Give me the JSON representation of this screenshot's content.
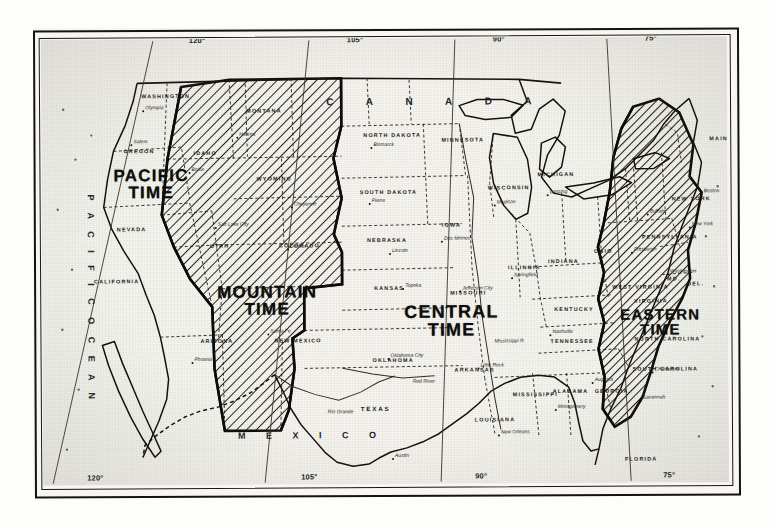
{
  "map": {
    "title": "Standard Time Zones of the United States",
    "paper_color": "#f6f5f0",
    "ink_color": "#15130f"
  },
  "zones": [
    {
      "id": "pacific",
      "line1": "PACIFIC",
      "line2": "TIME",
      "hatched": false
    },
    {
      "id": "mountain",
      "line1": "MOUNTAIN",
      "line2": "TIME",
      "hatched": true
    },
    {
      "id": "central",
      "line1": "CENTRAL",
      "line2": "TIME",
      "hatched": false
    },
    {
      "id": "eastern",
      "line1": "EASTERN",
      "line2": "TIME",
      "hatched": true
    }
  ],
  "countries": {
    "canada": "C A N A D A",
    "mexico": "M E X I C O"
  },
  "oceans": {
    "pacific": "P A C I F I C   O C E A N",
    "atlantic": "A T L A N T I C   O C E A N"
  },
  "longitude_top": [
    {
      "label": "120°",
      "x": 148
    },
    {
      "label": "105°",
      "x": 306
    },
    {
      "label": "90°",
      "x": 452
    },
    {
      "label": "75°",
      "x": 604
    }
  ],
  "longitude_bottom": [
    {
      "label": "120°",
      "x": 44
    },
    {
      "label": "105°",
      "x": 258
    },
    {
      "label": "90°",
      "x": 432
    },
    {
      "label": "75°",
      "x": 620
    }
  ],
  "states": [
    {
      "name": "WASHINGTON",
      "x": 100,
      "y": 55,
      "size": "sm"
    },
    {
      "name": "OREGON",
      "x": 82,
      "y": 110,
      "size": "sm"
    },
    {
      "name": "NEVADA",
      "x": 75,
      "y": 188,
      "size": "sm"
    },
    {
      "name": "CALIFORNIA",
      "x": 52,
      "y": 240,
      "size": "sm"
    },
    {
      "name": "IDAHO",
      "x": 152,
      "y": 112,
      "size": "sm"
    },
    {
      "name": "MONTANA",
      "x": 205,
      "y": 70,
      "size": "sm"
    },
    {
      "name": "WYOMING",
      "x": 215,
      "y": 138,
      "size": "sm"
    },
    {
      "name": "UTAH",
      "x": 168,
      "y": 205,
      "size": "sm"
    },
    {
      "name": "COLORADO",
      "x": 237,
      "y": 205,
      "size": "sm"
    },
    {
      "name": "ARIZONA",
      "x": 158,
      "y": 300,
      "size": "sm"
    },
    {
      "name": "NEW MEXICO",
      "x": 232,
      "y": 300,
      "size": "sm"
    },
    {
      "name": "NORTH DAKOTA",
      "x": 322,
      "y": 95,
      "size": "sm"
    },
    {
      "name": "SOUTH DAKOTA",
      "x": 318,
      "y": 152,
      "size": "sm"
    },
    {
      "name": "NEBRASKA",
      "x": 325,
      "y": 200,
      "size": "sm"
    },
    {
      "name": "KANSAS",
      "x": 332,
      "y": 248,
      "size": "sm"
    },
    {
      "name": "OKLAHOMA",
      "x": 330,
      "y": 320,
      "size": "sm"
    },
    {
      "name": "TEXAS",
      "x": 318,
      "y": 368,
      "size": "mid"
    },
    {
      "name": "MINNESOTA",
      "x": 400,
      "y": 100,
      "size": "sm"
    },
    {
      "name": "IOWA",
      "x": 400,
      "y": 185,
      "size": "sm"
    },
    {
      "name": "MISSOURI",
      "x": 408,
      "y": 253,
      "size": "sm"
    },
    {
      "name": "ARKANSAS",
      "x": 412,
      "y": 330,
      "size": "sm"
    },
    {
      "name": "LOUISIANA",
      "x": 432,
      "y": 380,
      "size": "sm"
    },
    {
      "name": "WISCONSIN",
      "x": 446,
      "y": 148,
      "size": "sm"
    },
    {
      "name": "ILLINOIS",
      "x": 466,
      "y": 228,
      "size": "sm"
    },
    {
      "name": "MISSISSIPPI",
      "x": 470,
      "y": 355,
      "size": "sm"
    },
    {
      "name": "MICHIGAN",
      "x": 496,
      "y": 135,
      "size": "sm"
    },
    {
      "name": "INDIANA",
      "x": 506,
      "y": 222,
      "size": "sm"
    },
    {
      "name": "KENTUCKY",
      "x": 512,
      "y": 270,
      "size": "sm"
    },
    {
      "name": "TENNESSEE",
      "x": 508,
      "y": 302,
      "size": "sm"
    },
    {
      "name": "ALABAMA",
      "x": 510,
      "y": 352,
      "size": "sm"
    },
    {
      "name": "OHIO",
      "x": 552,
      "y": 212,
      "size": "sm"
    },
    {
      "name": "GEORGIA",
      "x": 552,
      "y": 352,
      "size": "sm"
    },
    {
      "name": "FLORIDA",
      "x": 582,
      "y": 420,
      "size": "sm"
    },
    {
      "name": "WEST VIRGINIA",
      "x": 570,
      "y": 248,
      "size": "sm"
    },
    {
      "name": "VIRGINIA",
      "x": 592,
      "y": 262,
      "size": "sm"
    },
    {
      "name": "NORTH CAROLINA",
      "x": 592,
      "y": 300,
      "size": "sm"
    },
    {
      "name": "SOUTH CAROLINA",
      "x": 590,
      "y": 330,
      "size": "sm"
    },
    {
      "name": "PENNSYLVANIA",
      "x": 600,
      "y": 198,
      "size": "sm"
    },
    {
      "name": "NEW YORK",
      "x": 630,
      "y": 160,
      "size": "sm"
    },
    {
      "name": "MAINE",
      "x": 668,
      "y": 100,
      "size": "sm"
    },
    {
      "name": "DEL.",
      "x": 645,
      "y": 245,
      "size": "sm"
    },
    {
      "name": "MD.",
      "x": 625,
      "y": 240,
      "size": "sm"
    }
  ],
  "cities": [
    {
      "name": "Olympia",
      "x": 104,
      "y": 66
    },
    {
      "name": "Salem",
      "x": 92,
      "y": 100
    },
    {
      "name": "Boise",
      "x": 150,
      "y": 128
    },
    {
      "name": "Helena",
      "x": 198,
      "y": 93
    },
    {
      "name": "Cheyenne",
      "x": 252,
      "y": 163
    },
    {
      "name": "Salt Lake City",
      "x": 176,
      "y": 183
    },
    {
      "name": "Denver",
      "x": 248,
      "y": 205
    },
    {
      "name": "Santa Fe",
      "x": 228,
      "y": 290
    },
    {
      "name": "Phoenix",
      "x": 152,
      "y": 318
    },
    {
      "name": "Bismarck",
      "x": 332,
      "y": 104
    },
    {
      "name": "Pierre",
      "x": 330,
      "y": 160
    },
    {
      "name": "Lincoln",
      "x": 350,
      "y": 210
    },
    {
      "name": "Topeka",
      "x": 363,
      "y": 245
    },
    {
      "name": "Des Moines",
      "x": 402,
      "y": 198
    },
    {
      "name": "Jefferson City",
      "x": 420,
      "y": 248
    },
    {
      "name": "Springfield",
      "x": 472,
      "y": 235
    },
    {
      "name": "Madison",
      "x": 455,
      "y": 162
    },
    {
      "name": "Lansing",
      "x": 508,
      "y": 152
    },
    {
      "name": "Nashville",
      "x": 510,
      "y": 292
    },
    {
      "name": "Little Rock",
      "x": 438,
      "y": 325
    },
    {
      "name": "Oklahoma City",
      "x": 348,
      "y": 315
    },
    {
      "name": "Austin",
      "x": 352,
      "y": 415
    },
    {
      "name": "New Orleans",
      "x": 458,
      "y": 392
    },
    {
      "name": "Montgomery",
      "x": 515,
      "y": 367
    },
    {
      "name": "Augusta",
      "x": 552,
      "y": 340
    },
    {
      "name": "Savannah",
      "x": 600,
      "y": 358
    },
    {
      "name": "Buffalo",
      "x": 608,
      "y": 172
    },
    {
      "name": "New York",
      "x": 650,
      "y": 185
    },
    {
      "name": "Boston",
      "x": 662,
      "y": 152
    },
    {
      "name": "Washington",
      "x": 628,
      "y": 232
    },
    {
      "name": "Pittsburgh",
      "x": 592,
      "y": 210
    },
    {
      "name": "Charleston",
      "x": 612,
      "y": 330
    }
  ],
  "rivers": [
    {
      "name": "Red River",
      "x": 370,
      "y": 340
    },
    {
      "name": "Rio Grande",
      "x": 285,
      "y": 370
    },
    {
      "name": "Mississippi R.",
      "x": 452,
      "y": 300
    }
  ]
}
